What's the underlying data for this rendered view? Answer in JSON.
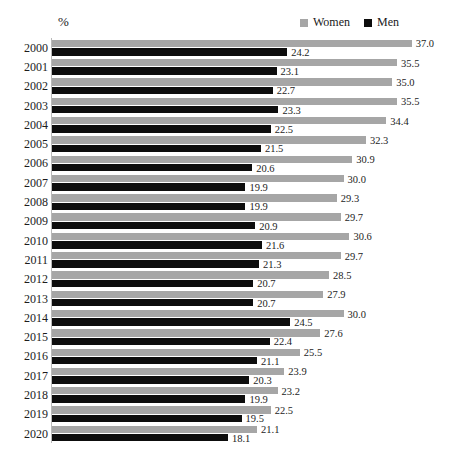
{
  "unit_label": "%",
  "legend": {
    "position": "top-right",
    "entries": [
      {
        "name": "women",
        "label": "Women",
        "color": "#a6a6a6",
        "swatch": "square-swatch"
      },
      {
        "name": "men",
        "label": "Men",
        "color": "#0d0d0d",
        "swatch": "square-swatch"
      }
    ]
  },
  "chart_data": {
    "type": "bar",
    "orientation": "horizontal",
    "title": "",
    "subtitle": "",
    "xlabel": "",
    "ylabel": "",
    "unit": "%",
    "grid": false,
    "legend_position": "top-right",
    "xlim": [
      0,
      37.0
    ],
    "categories": [
      "2000",
      "2001",
      "2002",
      "2003",
      "2004",
      "2005",
      "2006",
      "2007",
      "2008",
      "2009",
      "2010",
      "2011",
      "2012",
      "2013",
      "2014",
      "2015",
      "2016",
      "2017",
      "2018",
      "2019",
      "2020"
    ],
    "series": [
      {
        "name": "Women",
        "color": "#a6a6a6",
        "values": [
          37.0,
          35.5,
          35.0,
          35.5,
          34.4,
          32.3,
          30.9,
          30.0,
          29.3,
          29.7,
          30.6,
          29.7,
          28.5,
          27.9,
          30.0,
          27.6,
          25.5,
          23.9,
          23.2,
          22.5,
          21.1
        ],
        "labels": [
          "37.0",
          "35.5",
          "35.0",
          "35.5",
          "34.4",
          "32.3",
          "30.9",
          "30.0",
          "29.3",
          "29.7",
          "30.6",
          "29.7",
          "28.5",
          "27.9",
          "30.0",
          "27.6",
          "25.5",
          "23.9",
          "23.2",
          "22.5",
          "21.1"
        ]
      },
      {
        "name": "Men",
        "color": "#0d0d0d",
        "values": [
          24.2,
          23.1,
          22.7,
          23.3,
          22.5,
          21.5,
          20.6,
          19.9,
          19.9,
          20.9,
          21.6,
          21.3,
          20.7,
          20.7,
          24.5,
          22.4,
          21.1,
          20.3,
          19.9,
          19.5,
          18.1
        ],
        "labels": [
          "24.2",
          "23.1",
          "22.7",
          "23.3",
          "22.5",
          "21.5",
          "20.6",
          "19.9",
          "19.9",
          "20.9",
          "21.6",
          "21.3",
          "20.7",
          "20.7",
          "24.5",
          "22.4",
          "21.1",
          "20.3",
          "19.9",
          "19.5",
          "18.1"
        ]
      }
    ]
  }
}
